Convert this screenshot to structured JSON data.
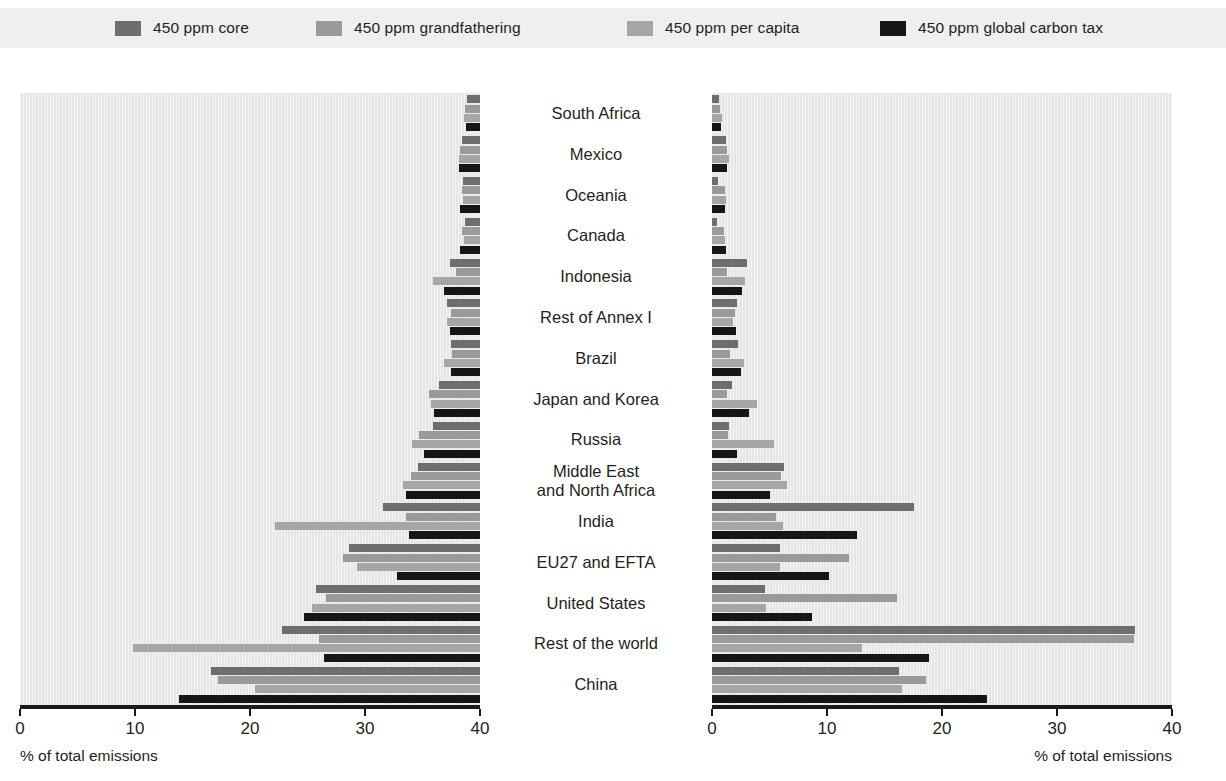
{
  "legend": {
    "items": [
      {
        "label": "450 ppm core",
        "color": "#6e6e6e",
        "x": 115
      },
      {
        "label": "450 ppm grandfathering",
        "color": "#9a9a9a",
        "x": 316
      },
      {
        "label": "450 ppm per capita",
        "color": "#a6a6a6",
        "x": 627
      },
      {
        "label": "450 ppm global carbon tax",
        "color": "#161616",
        "x": 880
      }
    ]
  },
  "chart_data": {
    "type": "bar",
    "orientation": "horizontal",
    "title": "",
    "xlabel": "% of total emissions",
    "ylabel": "",
    "xlim": [
      0,
      40
    ],
    "ticks": [
      0,
      10,
      20,
      30,
      40
    ],
    "grid": true,
    "legend_position": "top",
    "panels": [
      {
        "name": "left",
        "axis_caption": "% of total emissions",
        "direction": "right-to-left",
        "tick_labels": [
          "40",
          "30",
          "20",
          "10",
          "0"
        ]
      },
      {
        "name": "right",
        "axis_caption": "% of total emissions",
        "direction": "left-to-right",
        "tick_labels": [
          "0",
          "10",
          "20",
          "30",
          "40"
        ]
      }
    ],
    "categories": [
      "South Africa",
      "Mexico",
      "Oceania",
      "Canada",
      "Indonesia",
      "Rest of Annex I",
      "Brazil",
      "Japan and Korea",
      "Russia",
      "Middle East\nand North Africa",
      "India",
      "EU27 and EFTA",
      "United States",
      "Rest of the world",
      "China"
    ],
    "series": [
      {
        "name": "450 ppm core",
        "color": "#6e6e6e",
        "left_values": [
          1.1,
          1.6,
          1.5,
          1.3,
          2.6,
          2.9,
          2.5,
          3.6,
          4.1,
          5.4,
          8.4,
          11.4,
          14.3,
          17.2,
          23.4
        ],
        "right_values": [
          0.6,
          1.2,
          0.5,
          0.4,
          3.0,
          2.2,
          2.3,
          1.7,
          1.5,
          6.3,
          17.6,
          5.9,
          4.6,
          36.8,
          16.3
        ]
      },
      {
        "name": "450 ppm grandfathering",
        "color": "#9a9a9a",
        "left_values": [
          1.3,
          1.7,
          1.6,
          1.6,
          2.1,
          2.5,
          2.4,
          4.4,
          5.3,
          6.0,
          6.4,
          11.9,
          13.4,
          14.0,
          22.8
        ],
        "right_values": [
          0.7,
          1.3,
          1.1,
          1.0,
          1.3,
          2.0,
          1.6,
          1.3,
          1.4,
          6.0,
          5.6,
          11.9,
          16.1,
          36.7,
          18.6
        ]
      },
      {
        "name": "450 ppm per capita",
        "color": "#a6a6a6",
        "left_values": [
          1.4,
          1.8,
          1.5,
          1.4,
          4.1,
          2.9,
          3.1,
          4.3,
          5.9,
          6.7,
          17.8,
          10.7,
          14.6,
          30.2,
          19.6
        ],
        "right_values": [
          0.9,
          1.5,
          1.2,
          1.1,
          2.9,
          1.8,
          2.8,
          3.9,
          5.4,
          6.5,
          6.2,
          5.9,
          4.7,
          13.0,
          16.5
        ]
      },
      {
        "name": "450 ppm global carbon tax",
        "color": "#161616",
        "left_values": [
          1.2,
          1.8,
          1.7,
          1.7,
          3.1,
          2.6,
          2.5,
          4.0,
          4.9,
          6.4,
          6.2,
          7.2,
          15.3,
          13.6,
          26.2
        ],
        "right_values": [
          0.8,
          1.3,
          1.1,
          1.2,
          2.6,
          2.1,
          2.5,
          3.2,
          2.2,
          5.0,
          12.6,
          10.2,
          8.7,
          18.9,
          23.9
        ]
      }
    ]
  }
}
